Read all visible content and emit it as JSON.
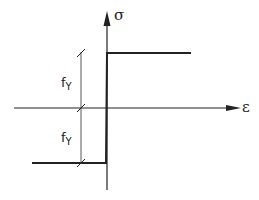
{
  "diagram": {
    "title": "",
    "type": "rigid-perfectly-plastic stress-strain diagram",
    "axes": {
      "vertical_label": "σ",
      "horizontal_label": "ε"
    },
    "dimension_labels": {
      "upper": {
        "base": "f",
        "subscript": "Y"
      },
      "lower": {
        "base": "f",
        "subscript": "Y"
      }
    },
    "colors": {
      "line": "#222222",
      "background": "#ffffff"
    }
  }
}
